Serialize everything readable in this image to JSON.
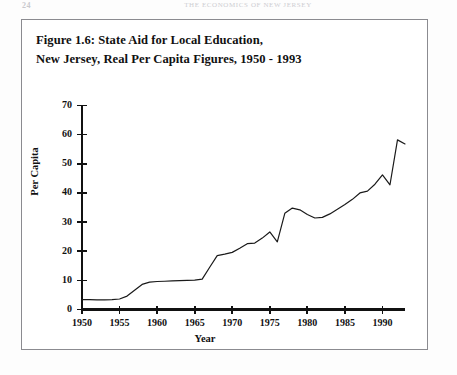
{
  "page": {
    "folio": "24",
    "running_header": "THE ECONOMICS OF NEW JERSEY",
    "background_color": "#ffffff",
    "frame_color": "#8b8b90"
  },
  "figure": {
    "caption_line1": "Figure 1.6: State Aid for Local Education,",
    "caption_line2": "New Jersey, Real Per Capita Figures, 1950 - 1993"
  },
  "chart_data": {
    "type": "line",
    "title": "Figure 1.6: State Aid for Local Education, New Jersey, Real Per Capita Figures, 1950 - 1993",
    "xlabel": "Year",
    "ylabel": "Per Capita",
    "xlim": [
      1950,
      1993
    ],
    "ylim": [
      0,
      70
    ],
    "xticks": [
      1950,
      1955,
      1960,
      1965,
      1970,
      1975,
      1980,
      1985,
      1990
    ],
    "xtick_labels": [
      "1950",
      "1955",
      "1960",
      "1965",
      "1970",
      "1975",
      "1980",
      "1985",
      "1990"
    ],
    "yticks": [
      0,
      10,
      20,
      30,
      40,
      50,
      60,
      70
    ],
    "ytick_labels": [
      "0",
      "10",
      "20",
      "30",
      "40",
      "50",
      "60",
      "70"
    ],
    "grid": false,
    "legend": null,
    "line_color": "#1a1a1a",
    "line_width": 1.2,
    "x": [
      1950,
      1951,
      1952,
      1953,
      1954,
      1955,
      1956,
      1957,
      1958,
      1959,
      1960,
      1961,
      1962,
      1963,
      1964,
      1965,
      1966,
      1967,
      1968,
      1969,
      1970,
      1971,
      1972,
      1973,
      1974,
      1975,
      1976,
      1977,
      1978,
      1979,
      1980,
      1981,
      1982,
      1983,
      1984,
      1985,
      1986,
      1987,
      1988,
      1989,
      1990,
      1991,
      1992,
      1993
    ],
    "values": [
      3.4,
      3.4,
      3.3,
      3.3,
      3.4,
      3.6,
      4.6,
      6.6,
      8.6,
      9.4,
      9.6,
      9.7,
      9.8,
      9.9,
      10.0,
      10.1,
      10.4,
      14.5,
      18.5,
      19.0,
      19.6,
      21.0,
      22.6,
      22.8,
      24.5,
      26.6,
      23.2,
      33.0,
      34.8,
      34.2,
      32.6,
      31.4,
      31.6,
      32.8,
      34.4,
      36.0,
      37.8,
      40.0,
      40.6,
      43.0,
      46.2,
      42.8,
      58.2,
      56.8
    ]
  }
}
